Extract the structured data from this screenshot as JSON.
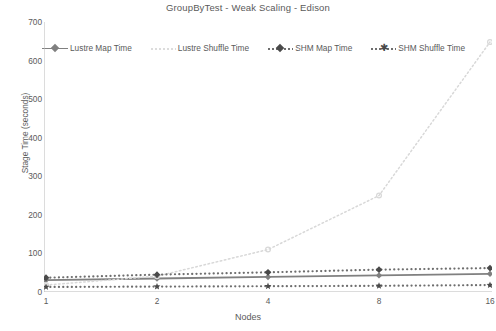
{
  "chart_data": {
    "type": "line",
    "title": "GroupByTest - Weak Scaling - Edison",
    "xlabel": "Nodes",
    "ylabel": "Stage Time (seconds)",
    "x": [
      1,
      2,
      4,
      8,
      16
    ],
    "xtick_labels": [
      "1",
      "2",
      "4",
      "8",
      "16"
    ],
    "ytick_labels": [
      "0",
      "100",
      "200",
      "300",
      "400",
      "500",
      "600",
      "700"
    ],
    "yticks": [
      0,
      100,
      200,
      300,
      400,
      500,
      600,
      700
    ],
    "ylim": [
      0,
      700
    ],
    "xscale": "log2-even",
    "grid": false,
    "legend_position": "top",
    "series": [
      {
        "name": "Lustre Map Time",
        "values": [
          31,
          35,
          39,
          43,
          47
        ],
        "color": "#808080",
        "style": "solid-marker",
        "marker": "diamond"
      },
      {
        "name": "Lustre Shuffle Time",
        "values": [
          18,
          41,
          110,
          250,
          648
        ],
        "color": "#d8d8d8",
        "style": "dotted-light",
        "marker": "circle"
      },
      {
        "name": "SHM Map Time",
        "values": [
          37,
          45,
          51,
          58,
          62
        ],
        "color": "#6e6e6e",
        "style": "dotted-marker",
        "marker": "diamond"
      },
      {
        "name": "SHM Shuffle Time",
        "values": [
          13,
          14,
          15,
          16,
          18
        ],
        "color": "#6e6e6e",
        "style": "dotted-marker",
        "marker": "star"
      }
    ]
  },
  "legend": {
    "items": [
      {
        "label": "Lustre Map Time",
        "marker": "line-diamond-marker"
      },
      {
        "label": "Lustre Shuffle Time",
        "marker": "dotted-light-marker"
      },
      {
        "label": "SHM Map Time",
        "marker": "dotted-diamond-marker"
      },
      {
        "label": "SHM Shuffle Time",
        "marker": "dotted-star-marker"
      }
    ]
  },
  "colors": {
    "text": "#5a5a5a",
    "axis": "#b9b9b9",
    "lustre_map": "#808080",
    "lustre_shuffle": "#d8d8d8",
    "shm_map": "#6e6e6e",
    "shm_shuffle": "#6e6e6e"
  }
}
